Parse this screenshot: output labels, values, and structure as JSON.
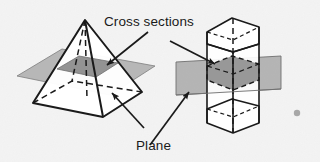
{
  "figure": {
    "background_color": "#f4f4f4",
    "width": 320,
    "height": 162
  },
  "labels": {
    "cross_sections": "Cross sections",
    "plane": "Plane"
  },
  "colors": {
    "ink": "#1a1a1a",
    "plane_fill": "#a9a9a9",
    "cross_section_fill": "#8d8d8d",
    "solid_fill": "#ffffff",
    "paper": "#f4f4f4",
    "artifact_dot": "#9a9a9a"
  },
  "shapes": {
    "pyramid": {
      "name": "square-pyramid",
      "apex": [
        85,
        20
      ],
      "base_vertices": [
        [
          33,
          103
        ],
        [
          103,
          117
        ],
        [
          142,
          92
        ],
        [
          72,
          81
        ]
      ],
      "cross_section_label": "square cross section",
      "cross_section_vertices": [
        [
          57,
          69
        ],
        [
          96,
          77
        ],
        [
          118,
          63
        ],
        [
          79,
          56
        ]
      ],
      "plane_vertices": [
        [
          17,
          76
        ],
        [
          110,
          95
        ],
        [
          155,
          66
        ],
        [
          62,
          49
        ]
      ]
    },
    "prism": {
      "name": "hexagonal-prism",
      "top_face_vertices": [
        [
          207,
          32
        ],
        [
          232,
          18
        ],
        [
          259,
          27
        ],
        [
          259,
          44
        ],
        [
          233,
          52
        ],
        [
          207,
          44
        ]
      ],
      "bottom_face_vertices": [
        [
          207,
          109
        ],
        [
          232,
          99
        ],
        [
          259,
          106
        ],
        [
          259,
          123
        ],
        [
          233,
          133
        ],
        [
          207,
          123
        ]
      ],
      "cross_section_label": "hexagonal cross section",
      "cross_section_vertices": [
        [
          207,
          66
        ],
        [
          232,
          56
        ],
        [
          259,
          64
        ],
        [
          259,
          80
        ],
        [
          233,
          90
        ],
        [
          207,
          80
        ]
      ],
      "plane_vertices": [
        [
          176,
          62
        ],
        [
          281,
          56
        ],
        [
          281,
          89
        ],
        [
          176,
          95
        ]
      ],
      "axis": [
        [
          233,
          18
        ],
        [
          233,
          133
        ]
      ]
    }
  },
  "annotations": [
    {
      "name": "arrow-cross-sections-to-pyramid",
      "from": [
        148,
        32
      ],
      "to": [
        106,
        65
      ],
      "target": "pyramid cross section"
    },
    {
      "name": "arrow-cross-sections-to-prism",
      "from": [
        170,
        41
      ],
      "to": [
        216,
        64
      ],
      "target": "prism cross section"
    },
    {
      "name": "arrow-plane-to-pyramid",
      "from": [
        144,
        128
      ],
      "to": [
        111,
        92
      ],
      "target": "pyramid plane"
    },
    {
      "name": "arrow-plane-to-prism",
      "from": [
        150,
        145
      ],
      "to": [
        190,
        92
      ],
      "target": "prism plane"
    }
  ],
  "artifact": {
    "name": "scan-speck",
    "position": [
      297,
      113
    ],
    "radius": 3.2
  }
}
